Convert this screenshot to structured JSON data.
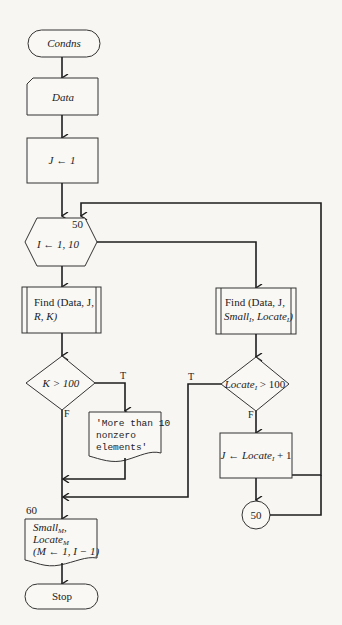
{
  "flowchart": {
    "start": {
      "label": "Condns"
    },
    "input_data": {
      "label": "Data"
    },
    "init": {
      "label": "J ← 1"
    },
    "loop": {
      "label": "I ← 1, 10",
      "statement_number": "50"
    },
    "find_left": {
      "line1": "Find (Data, J,",
      "line2": "R, K)"
    },
    "find_right": {
      "line1": "Find (Data, J,",
      "line2": "Small",
      "line2_sub": "I",
      "line2b": ", Locate",
      "line2b_sub": "I",
      "line2c": ")"
    },
    "decision_left": {
      "label": "K > 100",
      "true_label": "T",
      "false_label": "F"
    },
    "decision_right": {
      "label": "Locate",
      "label_sub": "I",
      "label_rest": " > 100",
      "true_label": "T",
      "false_label": "F"
    },
    "output_message": {
      "line1": "'More than 10",
      "line2": "nonzero",
      "line3": "elements'"
    },
    "assign_right": {
      "label": "J ← Locate",
      "label_sub": "I",
      "label_rest": " + 1"
    },
    "connector": {
      "label": "50"
    },
    "output_final": {
      "statement_number": "60",
      "line1": "Small",
      "line1_sub": "M",
      "line1_rest": ",",
      "line2": "Locate",
      "line2_sub": "M",
      "line3": "(M ← 1, I − 1)"
    },
    "end": {
      "label": "Stop"
    }
  }
}
